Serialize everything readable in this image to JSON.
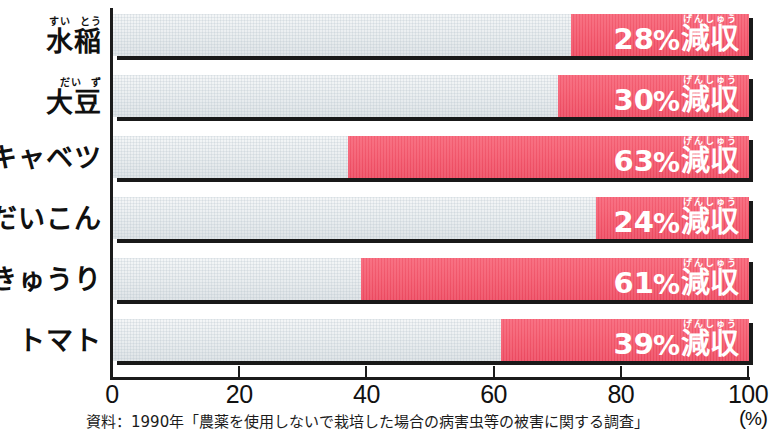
{
  "chart_data": {
    "type": "bar",
    "orientation": "horizontal",
    "title": "",
    "xlabel": "(%)",
    "ylabel": "",
    "xlim": [
      0,
      100
    ],
    "xticks": [
      0,
      20,
      40,
      60,
      80,
      100
    ],
    "grid": false,
    "legend": false,
    "categories": [
      "水稲",
      "大豆",
      "キャベツ",
      "だいこん",
      "きゅうり",
      "トマト"
    ],
    "category_ruby": [
      {
        "main": "水稲",
        "ruby": [
          "すい",
          "とう"
        ]
      },
      {
        "main": "大豆",
        "ruby": [
          "だい",
          "ず"
        ]
      },
      {
        "main": "キャベツ",
        "ruby": []
      },
      {
        "main": "だいこん",
        "ruby": []
      },
      {
        "main": "きゅうり",
        "ruby": []
      },
      {
        "main": "トマト",
        "ruby": []
      }
    ],
    "values": [
      28,
      30,
      63,
      24,
      61,
      39
    ],
    "value_unit": "%",
    "value_suffix": "減収",
    "value_suffix_ruby": "げんしゅう",
    "value_labels": [
      "28%減収",
      "30%減収",
      "63%減収",
      "24%減収",
      "61%減収",
      "39%減収"
    ],
    "bar_fill_origin": "right",
    "annotation": "資料：1990年「農薬を使用しないで栽培した場合の病害虫等の被害に関する調査」"
  },
  "axis": {
    "unit_label_open": "(",
    "unit_label_text": "%",
    "unit_label_close": ")",
    "tick_labels": [
      "0",
      "20",
      "40",
      "60",
      "80",
      "100"
    ]
  },
  "colors": {
    "bar_fill": "#f4566b",
    "bar_track": "#e9edef",
    "shadow": "#191919",
    "axis": "#1b1b1b",
    "text": "#111111",
    "value_text": "#ffffff"
  },
  "rows": [
    {
      "label_main": "水稲",
      "ruby1": "すい",
      "ruby2": "とう",
      "value": 28,
      "num": "28",
      "pct": "%",
      "word": "減収",
      "word_ruby": "げんしゅう"
    },
    {
      "label_main": "大豆",
      "ruby1": "だい",
      "ruby2": "ず",
      "value": 30,
      "num": "30",
      "pct": "%",
      "word": "減収",
      "word_ruby": "げんしゅう"
    },
    {
      "label_main": "キャベツ",
      "ruby1": "",
      "ruby2": "",
      "value": 63,
      "num": "63",
      "pct": "%",
      "word": "減収",
      "word_ruby": "げんしゅう"
    },
    {
      "label_main": "だいこん",
      "ruby1": "",
      "ruby2": "",
      "value": 24,
      "num": "24",
      "pct": "%",
      "word": "減収",
      "word_ruby": "げんしゅう"
    },
    {
      "label_main": "きゅうり",
      "ruby1": "",
      "ruby2": "",
      "value": 61,
      "num": "61",
      "pct": "%",
      "word": "減収",
      "word_ruby": "げんしゅう"
    },
    {
      "label_main": "トマト",
      "ruby1": "",
      "ruby2": "",
      "value": 39,
      "num": "39",
      "pct": "%",
      "word": "減収",
      "word_ruby": "げんしゅう"
    }
  ],
  "footer": {
    "source": "資料：1990年「農薬を使用しないで栽培した場合の病害虫等の被害に関する調査」"
  }
}
